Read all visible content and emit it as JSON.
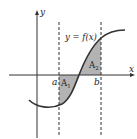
{
  "diagram": {
    "type": "area-between-curve-and-axis",
    "axes": {
      "x_label": "x",
      "y_label": "y"
    },
    "curve_label": "y = f(x)",
    "bounds": {
      "a_label": "a",
      "b_label": "b"
    },
    "regions": [
      {
        "label": "A",
        "subscript": "1",
        "position": "below x-axis"
      },
      {
        "label": "A",
        "subscript": "2",
        "position": "above x-axis"
      }
    ],
    "colors": {
      "shade": "#b3b3b3",
      "line": "#333333",
      "background": "#ffffff"
    }
  }
}
